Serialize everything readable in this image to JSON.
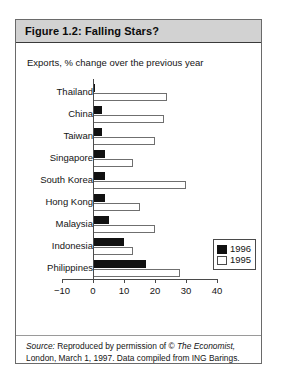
{
  "figure": {
    "title": "Figure 1.2:  Falling Stars?",
    "subtitle": "Exports, % change over the previous year",
    "source_prefix": "Source:",
    "source_line1_a": " Reproduced by permission of © ",
    "source_line1_b": "The Economist,",
    "source_line2": "London, March 1, 1997. Data compiled from ING Barings."
  },
  "legend": {
    "items": [
      {
        "label": "1996",
        "color": "#111111",
        "style": "filled"
      },
      {
        "label": "1995",
        "color": "#ffffff",
        "style": "outlined"
      }
    ]
  },
  "chart_data": {
    "type": "bar",
    "orientation": "horizontal",
    "title": "Figure 1.2:  Falling Stars?",
    "subtitle": "Exports, % change over the previous year",
    "xlabel": "",
    "ylabel": "",
    "xlim": [
      -10,
      40
    ],
    "xticks": [
      -10,
      0,
      10,
      20,
      30,
      40
    ],
    "xtick_labels": [
      "−10",
      "0",
      "10",
      "20",
      "30",
      "40"
    ],
    "grid": false,
    "legend_position": "inside-right",
    "categories": [
      "Thailand",
      "China",
      "Taiwan",
      "Singapore",
      "South Korea",
      "Hong Kong",
      "Malaysia",
      "Indonesia",
      "Philippines"
    ],
    "series": [
      {
        "name": "1996",
        "color": "#111111",
        "values": [
          0.3,
          3,
          3,
          4,
          4,
          4,
          5,
          10,
          17
        ]
      },
      {
        "name": "1995",
        "color": "#ffffff",
        "values": [
          24,
          23,
          20,
          13,
          30,
          15,
          20,
          13,
          28
        ]
      }
    ]
  }
}
